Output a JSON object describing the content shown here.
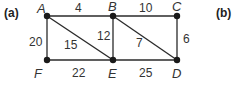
{
  "panels": [
    {
      "id": "a",
      "label": "(a)",
      "x": 4,
      "y": 17
    },
    {
      "id": "b",
      "label": "(b)",
      "x": 216,
      "y": 17
    }
  ],
  "graph": {
    "nodes": [
      {
        "id": "A",
        "label": "A",
        "x": 47,
        "y": 16,
        "lx": 37,
        "ly": 13
      },
      {
        "id": "B",
        "label": "B",
        "x": 113,
        "y": 16,
        "lx": 108,
        "ly": 11
      },
      {
        "id": "C",
        "label": "C",
        "x": 177,
        "y": 16,
        "lx": 172,
        "ly": 11
      },
      {
        "id": "D",
        "label": "D",
        "x": 177,
        "y": 60,
        "lx": 172,
        "ly": 78
      },
      {
        "id": "E",
        "label": "E",
        "x": 113,
        "y": 60,
        "lx": 108,
        "ly": 78
      },
      {
        "id": "F",
        "label": "F",
        "x": 47,
        "y": 60,
        "lx": 34,
        "ly": 78
      }
    ],
    "edges": [
      {
        "from": "A",
        "to": "B",
        "weight": "4",
        "wx": 75,
        "wy": 12
      },
      {
        "from": "B",
        "to": "C",
        "weight": "10",
        "wx": 139,
        "wy": 12
      },
      {
        "from": "A",
        "to": "F",
        "weight": "20",
        "wx": 29,
        "wy": 46
      },
      {
        "from": "A",
        "to": "E",
        "weight": "15",
        "wx": 64,
        "wy": 49
      },
      {
        "from": "B",
        "to": "E",
        "weight": "12",
        "wx": 97,
        "wy": 40
      },
      {
        "from": "B",
        "to": "D",
        "weight": "7",
        "wx": 136,
        "wy": 47
      },
      {
        "from": "C",
        "to": "D",
        "weight": "6",
        "wx": 183,
        "wy": 43
      },
      {
        "from": "F",
        "to": "E",
        "weight": "22",
        "wx": 72,
        "wy": 77
      },
      {
        "from": "E",
        "to": "D",
        "weight": "25",
        "wx": 139,
        "wy": 77
      }
    ]
  }
}
